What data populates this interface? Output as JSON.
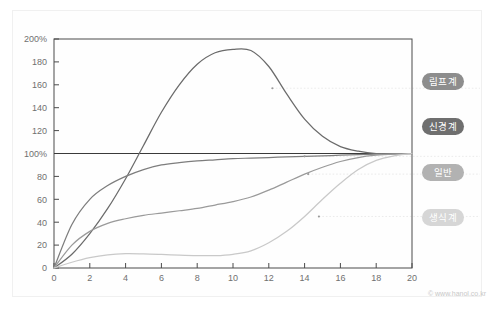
{
  "chart_data": {
    "type": "line",
    "title": "",
    "xlabel": "",
    "ylabel": "",
    "xlim": [
      0,
      20
    ],
    "ylim": [
      0,
      200
    ],
    "grid": false,
    "reference_line": {
      "value": 100,
      "label": "100%"
    },
    "x_ticks": [
      "0",
      "2",
      "4",
      "6",
      "8",
      "10",
      "12",
      "14",
      "16",
      "18",
      "20"
    ],
    "y_ticks": [
      "0",
      "20",
      "40",
      "60",
      "80",
      "100%",
      "120",
      "140",
      "160",
      "180",
      "200%"
    ],
    "legend_position": "right",
    "x": [
      0,
      1,
      2,
      3,
      4,
      5,
      6,
      7,
      8,
      9,
      10,
      11,
      12,
      13,
      14,
      15,
      16,
      17,
      18,
      19,
      20
    ],
    "series": [
      {
        "name": "림프계",
        "color": "#6b6b6b",
        "values": [
          0,
          12,
          30,
          52,
          78,
          107,
          136,
          160,
          178,
          188,
          191,
          190,
          176,
          152,
          130,
          115,
          106,
          102,
          100,
          100,
          100
        ]
      },
      {
        "name": "신경계",
        "color": "#7d7d7d",
        "values": [
          0,
          38,
          60,
          72,
          80,
          86,
          90,
          92,
          93.5,
          94.5,
          95.5,
          96,
          96.5,
          97,
          97.5,
          98,
          98.5,
          99,
          99.5,
          99.8,
          100
        ]
      },
      {
        "name": "일반",
        "color": "#9a9a9a",
        "values": [
          0,
          20,
          32,
          39,
          43,
          46,
          48,
          50,
          52,
          55,
          58,
          62,
          68,
          75,
          82,
          88,
          93,
          96.5,
          98.5,
          99.5,
          100
        ]
      },
      {
        "name": "생식계",
        "color": "#c9c9c9",
        "values": [
          0,
          5,
          9,
          11.5,
          12.5,
          12.3,
          11.8,
          11.2,
          10.8,
          10.8,
          12,
          15,
          22,
          32,
          45,
          60,
          74,
          86,
          94,
          98,
          100
        ]
      }
    ],
    "annotations": [
      {
        "series": "림프계",
        "x": 12.2,
        "y": 157
      },
      {
        "series": "신경계",
        "x": 14.0,
        "y": 97.5
      },
      {
        "series": "일반",
        "x": 14.2,
        "y": 82
      },
      {
        "series": "생식계",
        "x": 14.8,
        "y": 45
      }
    ]
  },
  "legend": {
    "items": [
      {
        "label": "림프계",
        "color": "#8d8d8d",
        "top": 73
      },
      {
        "label": "신경계",
        "color": "#6f6f6f",
        "top": 118
      },
      {
        "label": "일반",
        "color": "#b2b2b2",
        "top": 164
      },
      {
        "label": "생식계",
        "color": "#d6d6d6",
        "top": 209
      }
    ]
  },
  "caption": {
    "text": ""
  },
  "watermark": {
    "text": "© www.hanol.co.kr"
  },
  "colors": {
    "axis": "#4a4a4a",
    "tick_text": "#707070",
    "reference_line": "#3a3a3a",
    "panel_border": "#f0f0f0",
    "leader_line": "#e4e4e4"
  }
}
